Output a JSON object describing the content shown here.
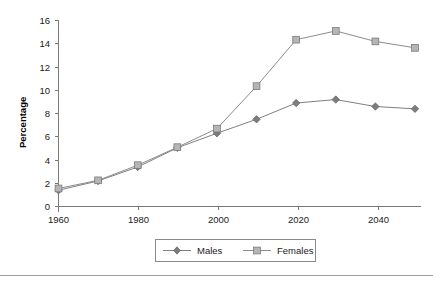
{
  "chart_data": {
    "type": "line",
    "title": "",
    "subtitle": "",
    "xlabel": "",
    "ylabel": "Percentage",
    "x": [
      1960,
      1970,
      1980,
      1990,
      2000,
      2010,
      2020,
      2030,
      2040,
      2050
    ],
    "xtick_labels": [
      "1960",
      "1980",
      "2000",
      "2020",
      "2040"
    ],
    "xtick_values": [
      1960,
      1980,
      2000,
      2020,
      2040
    ],
    "xlim": [
      1960,
      2050
    ],
    "ytick_labels": [
      "0",
      "2",
      "4",
      "6",
      "8",
      "10",
      "12",
      "14",
      "16"
    ],
    "ytick_values": [
      0,
      2,
      4,
      6,
      8,
      10,
      12,
      14,
      16
    ],
    "ylim": [
      0,
      16
    ],
    "grid": false,
    "legend_position": "bottom",
    "series": [
      {
        "name": "Males",
        "marker": "diamond",
        "color": "#808080",
        "marker_color": "#7d7d7d",
        "values": [
          1.4,
          2.2,
          3.4,
          5.05,
          6.3,
          7.5,
          8.9,
          9.2,
          8.6,
          8.4
        ]
      },
      {
        "name": "Females",
        "marker": "square",
        "color": "#8c8c8c",
        "marker_color": "#b5b5b5",
        "values": [
          1.55,
          2.25,
          3.55,
          5.1,
          6.7,
          10.35,
          14.35,
          15.1,
          14.2,
          13.65
        ]
      }
    ]
  },
  "legend": {
    "items": [
      {
        "label": "Males"
      },
      {
        "label": "Females"
      }
    ]
  },
  "colors": {
    "axis": "#7a7a7a",
    "text": "#1a1a1a",
    "males_line": "#808080",
    "females_line": "#8c8c8c",
    "males_marker": "#7d7d7d",
    "females_marker": "#b5b5b5",
    "footer_rule": "#9a9a9a"
  }
}
